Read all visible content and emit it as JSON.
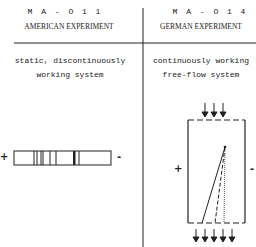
{
  "left_panel": {
    "code": "M A - O 1 1",
    "title": "AMERICAN EXPERIMENT",
    "description_line1": "static, discontinuously",
    "description_line2": "working system",
    "plus_label": "+",
    "minus_label": "-"
  },
  "right_panel": {
    "code": "M A - O 1 4",
    "title": "GERMAN EXPERIMENT",
    "description_line1": "continuously working",
    "description_line2": "free-flow system",
    "plus_label": "+",
    "minus_label": "-"
  },
  "colors": {
    "ink": "#222222",
    "background": "#ffffff"
  }
}
